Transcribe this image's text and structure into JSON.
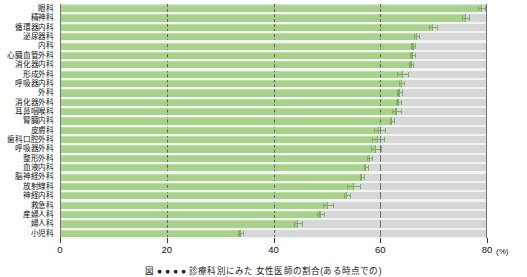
{
  "chart_data": {
    "type": "bar",
    "orientation": "horizontal",
    "title": "",
    "xlabel": "(%)",
    "ylabel": "",
    "xlim": [
      0,
      80
    ],
    "xticks": [
      0,
      20,
      40,
      60
    ],
    "xtick_labels": [
      "0",
      "20",
      "40",
      "60"
    ],
    "last_tick_label": "80",
    "unit_label": "(%)",
    "grid": "vertical dashed gridlines at 20, 40, 60",
    "legend": "none",
    "bar_color": "#a8d28b",
    "plot_background": "#d6d8d8",
    "error_bars": true,
    "categories": [
      "眼科",
      "精神科",
      "循環器内科",
      "泌尿器科",
      "内科",
      "心臓血管外科",
      "消化器内科",
      "形成外科",
      "呼吸器内科",
      "外科",
      "消化器外科",
      "耳鼻咽喉科",
      "腎臓内科",
      "皮膚科",
      "歯科口腔外科",
      "呼吸器外科",
      "整形外科",
      "血液内科",
      "脳神経外科",
      "放射線科",
      "神経内科",
      "救急科",
      "産婦人科",
      "婦人科",
      "小児科"
    ],
    "values": [
      79.0,
      76.0,
      69.9,
      66.8,
      66.2,
      66.0,
      65.8,
      64.2,
      64.0,
      63.6,
      63.4,
      63.0,
      62.2,
      59.8,
      59.6,
      59.2,
      58.0,
      57.3,
      56.6,
      55.0,
      53.8,
      50.2,
      48.8,
      44.6,
      33.8
    ],
    "errors": [
      0.6,
      0.7,
      0.7,
      0.5,
      0.4,
      0.5,
      0.4,
      1.0,
      0.5,
      0.4,
      0.4,
      0.8,
      0.4,
      1.0,
      1.1,
      0.9,
      0.5,
      0.4,
      0.4,
      1.2,
      0.5,
      1.0,
      0.7,
      0.7,
      0.4
    ]
  },
  "caption": "図 ● ● ● ● 診療科別にみた 女性医師の割合(ある時点での)"
}
